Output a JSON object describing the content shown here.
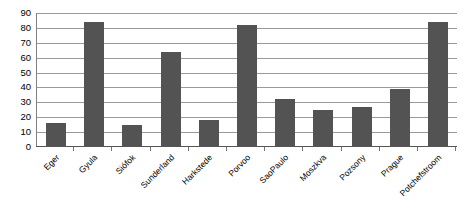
{
  "chart_data": {
    "type": "bar",
    "title": "",
    "xlabel": "",
    "ylabel": "",
    "categories": [
      "Eger",
      "Gyula",
      "Siófok",
      "Sunderland",
      "Harkstede",
      "Porvoo",
      "SaoPaulo",
      "Moszkva",
      "Pozsony",
      "Prague",
      "Potchefstroom"
    ],
    "values": [
      16,
      84,
      15,
      64,
      18,
      82,
      32,
      25,
      27,
      39,
      84
    ],
    "ylim": [
      0,
      90
    ],
    "y_ticks": [
      0,
      10,
      20,
      30,
      40,
      50,
      60,
      70,
      80,
      90
    ],
    "y_tick_labels": [
      "0",
      "10",
      "20",
      "30",
      "40",
      "50",
      "60",
      "70",
      "80",
      "90"
    ],
    "grid": true,
    "legend": false,
    "legend_position": "none",
    "bar_color": "#535353",
    "gridline_color": "#9a9a9a",
    "axis_color": "#808080",
    "background_color": "#ffffff"
  }
}
